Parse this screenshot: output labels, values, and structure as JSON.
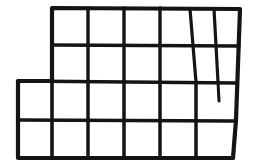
{
  "figure": {
    "name": "hand-drawn-polyomino-grid",
    "canvas": {
      "width": 255,
      "height": 168,
      "background_color": "#ffffff"
    },
    "ink_color": "#141414",
    "stroke_width_outline": 4.2,
    "stroke_width_inner": 3.4,
    "stroke_width_stub": 3.0,
    "rows": 4,
    "row_y": [
      8,
      45,
      81,
      120,
      158
    ],
    "columns_upper": 6,
    "columns_lower": 6,
    "outline_path": "M 52 8 L 240 9 L 236 120 L 233 158 L 18 158 L 18 81 L 52 81 Z",
    "horizontal_lines": [
      {
        "name": "h-row1-row2",
        "x1": 52,
        "y1": 45,
        "x2": 239,
        "y2": 46
      },
      {
        "name": "h-row2-row3",
        "x1": 18,
        "y1": 81,
        "x2": 237,
        "y2": 83
      },
      {
        "name": "h-row3-row4",
        "x1": 18,
        "y1": 120,
        "x2": 235,
        "y2": 121
      }
    ],
    "vertical_lines": [
      {
        "name": "v-col1-upper",
        "x1": 88,
        "y1": 8,
        "x2": 88,
        "y2": 81
      },
      {
        "name": "v-col2-upper",
        "x1": 124,
        "y1": 8,
        "x2": 124,
        "y2": 81
      },
      {
        "name": "v-col3-upper",
        "x1": 160,
        "y1": 8,
        "x2": 160,
        "y2": 81
      },
      {
        "name": "v-col4-upper-slanted",
        "x1": 190,
        "y1": 9,
        "x2": 196,
        "y2": 82
      },
      {
        "name": "v-col5-upper",
        "x1": 214,
        "y1": 9,
        "x2": 218,
        "y2": 82
      },
      {
        "name": "v-col0-lower",
        "x1": 52,
        "y1": 81,
        "x2": 52,
        "y2": 158
      },
      {
        "name": "v-col1-lower",
        "x1": 88,
        "y1": 82,
        "x2": 88,
        "y2": 158
      },
      {
        "name": "v-col2-lower",
        "x1": 124,
        "y1": 82,
        "x2": 124,
        "y2": 158
      },
      {
        "name": "v-col3-lower",
        "x1": 160,
        "y1": 82,
        "x2": 160,
        "y2": 158
      },
      {
        "name": "v-col4-lower",
        "x1": 196,
        "y1": 82,
        "x2": 196,
        "y2": 158
      }
    ],
    "stub_line": {
      "name": "v-stub-partial",
      "x1": 218,
      "y1": 82,
      "x2": 219,
      "y2": 101
    },
    "left_edge_segment": {
      "x1": 18,
      "y1": 81,
      "x2": 52,
      "y2": 81
    }
  }
}
